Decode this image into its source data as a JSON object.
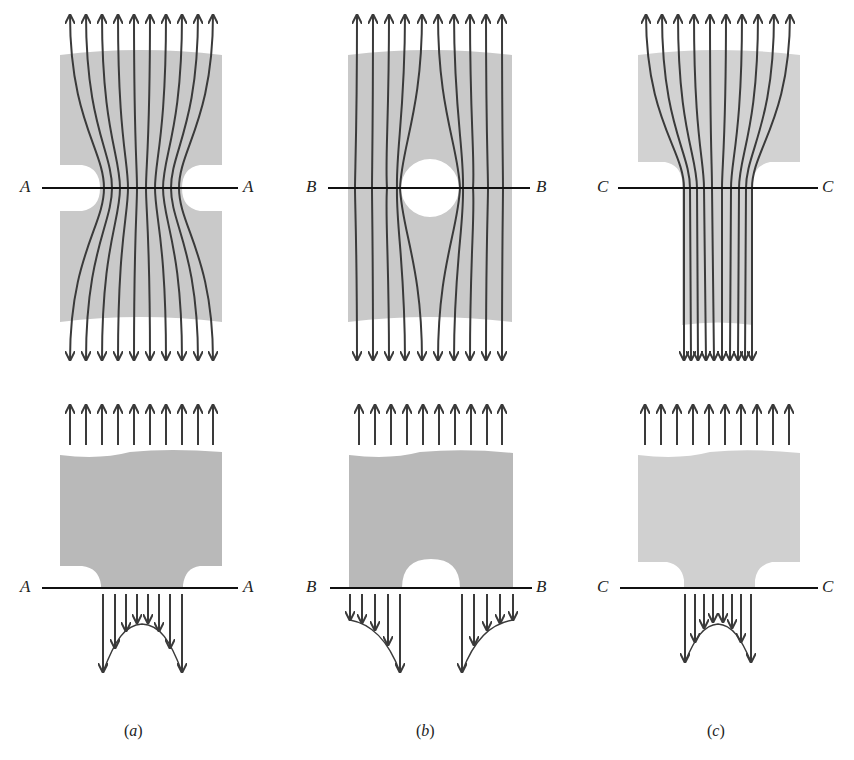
{
  "figure": {
    "colors": {
      "plate": "#c9c9c9",
      "plate_bottom": "#b9b9b9",
      "line": "#3a3a3a",
      "section_line": "#111111"
    },
    "panels": [
      {
        "id": "a",
        "caption": "(a)",
        "caption_letter": "a",
        "section_label": "A",
        "feature": "double edge notch",
        "distribution_shape": "peak at notch roots, minimum at center"
      },
      {
        "id": "b",
        "caption": "(b)",
        "caption_letter": "b",
        "section_label": "B",
        "feature": "central circular hole",
        "distribution_shape": "peak at hole edges, decreasing toward outer edges"
      },
      {
        "id": "c",
        "caption": "(c)",
        "caption_letter": "c",
        "section_label": "C",
        "feature": "shoulder fillet (width step)",
        "distribution_shape": "peak at fillet roots, minimum at center"
      }
    ]
  },
  "labels": {
    "a_top_left": "A",
    "a_top_right": "A",
    "b_top_left": "B",
    "b_top_right": "B",
    "c_top_left": "C",
    "c_top_right": "C",
    "a_bot_left": "A",
    "a_bot_right": "A",
    "b_bot_left": "B",
    "b_bot_right": "B",
    "c_bot_left": "C",
    "c_bot_right": "C",
    "cap_a": "a",
    "cap_b": "b",
    "cap_c": "c"
  }
}
